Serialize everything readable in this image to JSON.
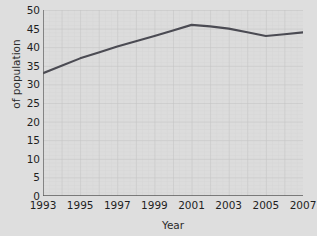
{
  "chart_data": {
    "type": "line",
    "title": "",
    "xlabel": "Year",
    "ylabel": "of population",
    "xlim": [
      1993,
      2007
    ],
    "ylim": [
      0,
      50
    ],
    "grid": true,
    "legend": false,
    "x_tick_labels": [
      "1993",
      "1995",
      "1997",
      "1999",
      "2001",
      "2003",
      "2005",
      "2007"
    ],
    "x_tick_values": [
      1993,
      1995,
      1997,
      1999,
      2001,
      2003,
      2005,
      2007
    ],
    "y_tick_labels": [
      "0",
      "5",
      "10",
      "15",
      "20",
      "25",
      "30",
      "35",
      "40",
      "45",
      "50"
    ],
    "y_tick_values": [
      0,
      5,
      10,
      15,
      20,
      25,
      30,
      35,
      40,
      45,
      50
    ],
    "x": [
      1993,
      1994,
      1995,
      1996,
      1997,
      1998,
      1999,
      2000,
      2001,
      2002,
      2003,
      2004,
      2005,
      2006,
      2007
    ],
    "values": [
      33,
      35,
      37,
      38.6,
      40.2,
      41.6,
      43,
      44.5,
      46,
      45.6,
      45,
      44,
      43,
      43.5,
      44
    ],
    "series": [
      {
        "name": "population",
        "color": "#4b4b53",
        "values": [
          33,
          35,
          37,
          38.6,
          40.2,
          41.6,
          43,
          44.5,
          46,
          45.6,
          45,
          44,
          43,
          43.5,
          44
        ]
      }
    ],
    "colors": {
      "background": "#dedede",
      "plot_background": "#dcdcdc",
      "grid_minor": "#d0d0d0",
      "grid_major": "#c4c4c4",
      "axis": "#5a5a5a",
      "line": "#4b4b53",
      "text": "#1f1f1f"
    }
  }
}
